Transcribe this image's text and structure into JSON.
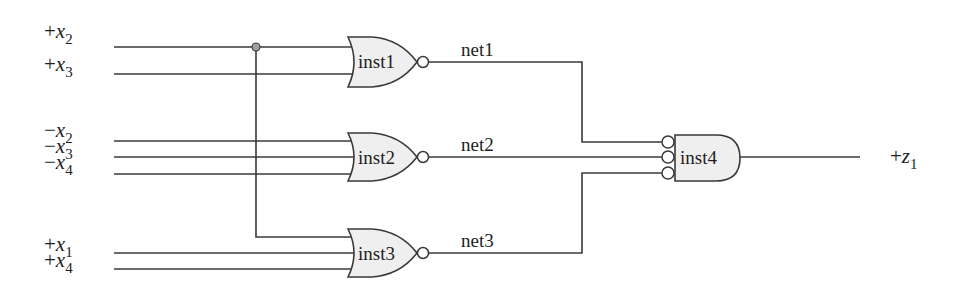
{
  "diagram": {
    "type": "logic-circuit",
    "colors": {
      "wire": "#3a3a3a",
      "gate_fill": "#efefef",
      "junction_dot": "#a0a0a0",
      "text": "#1e1e1e"
    },
    "inputs": [
      {
        "id": "in_x2_pos",
        "sign": "+",
        "var": "x",
        "sub": "2"
      },
      {
        "id": "in_x3_pos",
        "sign": "+",
        "var": "x",
        "sub": "3"
      },
      {
        "id": "in_x2_neg",
        "sign": "−",
        "var": "x",
        "sub": "2"
      },
      {
        "id": "in_x3_neg",
        "sign": "−",
        "var": "x",
        "sub": "3"
      },
      {
        "id": "in_x4_neg",
        "sign": "−",
        "var": "x",
        "sub": "4"
      },
      {
        "id": "in_x1_pos",
        "sign": "+",
        "var": "x",
        "sub": "1"
      },
      {
        "id": "in_x4_pos",
        "sign": "+",
        "var": "x",
        "sub": "4"
      }
    ],
    "gates": [
      {
        "name": "inst1",
        "type": "NOR",
        "inputs": [
          "+x2",
          "+x3"
        ],
        "output": "net1"
      },
      {
        "name": "inst2",
        "type": "NOR",
        "inputs": [
          "-x2",
          "-x3",
          "-x4"
        ],
        "output": "net2"
      },
      {
        "name": "inst3",
        "type": "NOR",
        "inputs": [
          "+x2",
          "+x1",
          "+x4"
        ],
        "output": "net3"
      },
      {
        "name": "inst4",
        "type": "AND (inverted inputs)",
        "inputs": [
          "net1",
          "net2",
          "net3"
        ],
        "output": "+z1"
      }
    ],
    "nets": [
      {
        "label": "net1"
      },
      {
        "label": "net2"
      },
      {
        "label": "net3"
      }
    ],
    "output": {
      "sign": "+",
      "var": "z",
      "sub": "1"
    }
  }
}
